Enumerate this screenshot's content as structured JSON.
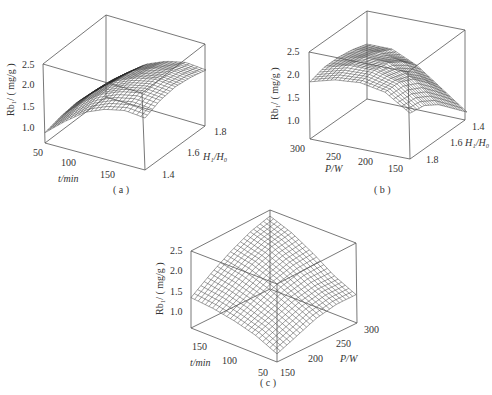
{
  "chart_data": [
    {
      "id": "a",
      "type": "surface3d",
      "caption": "( a )",
      "zlabel": "Rb₁/ ( mg/g )",
      "xlabel": "t/min",
      "ylabel": "H₁/H₀",
      "zticks": [
        "1.0",
        "1.5",
        "2.0",
        "2.5"
      ],
      "xticks": [
        "50",
        "100",
        "150"
      ],
      "yticks": [
        "1.4",
        "1.6",
        "1.8"
      ],
      "zlim": [
        0.6,
        2.5
      ],
      "xlim": [
        50,
        180
      ],
      "ylim": [
        1.3,
        1.9
      ],
      "surface_description": "Rises from ~0.9 at t=50 to plateau ~2.1 near t=150, peaks around H1/H0≈1.6",
      "grid_samples": {
        "x": [
          50,
          75,
          100,
          125,
          150,
          180
        ],
        "y": [
          1.3,
          1.45,
          1.6,
          1.75,
          1.9
        ],
        "z": [
          [
            0.85,
            0.95,
            1.0,
            0.95,
            0.9
          ],
          [
            1.25,
            1.4,
            1.45,
            1.4,
            1.3
          ],
          [
            1.6,
            1.75,
            1.8,
            1.75,
            1.65
          ],
          [
            1.8,
            1.95,
            2.0,
            1.95,
            1.85
          ],
          [
            1.9,
            2.05,
            2.1,
            2.05,
            1.95
          ],
          [
            1.85,
            2.0,
            2.05,
            2.0,
            1.9
          ]
        ]
      }
    },
    {
      "id": "b",
      "type": "surface3d",
      "caption": "( b )",
      "zlabel": "Rb₁/ ( mg/g )",
      "xlabel": "P/W",
      "ylabel": "H₁/H₀",
      "zticks": [
        "1.0",
        "1.5",
        "2.0",
        "2.5"
      ],
      "xticks": [
        "300",
        "250",
        "200",
        "150"
      ],
      "yticks": [
        "1.4",
        "1.6",
        "1.8"
      ],
      "zlim": [
        0.6,
        2.5
      ],
      "xlim": [
        300,
        140
      ],
      "ylim": [
        1.3,
        1.9
      ],
      "surface_description": "Dome-shaped; max ~2.1 near P≈230 W, H1/H0≈1.5; drops to ~0.8 at P=150, H1/H0=1.9",
      "grid_samples": {
        "x": [
          300,
          260,
          220,
          180,
          140
        ],
        "y": [
          1.3,
          1.45,
          1.6,
          1.75,
          1.9
        ],
        "z": [
          [
            1.85,
            1.95,
            1.95,
            1.9,
            1.8
          ],
          [
            2.0,
            2.1,
            2.05,
            1.95,
            1.8
          ],
          [
            2.05,
            2.1,
            2.05,
            1.85,
            1.55
          ],
          [
            1.95,
            1.95,
            1.8,
            1.5,
            1.15
          ],
          [
            1.6,
            1.55,
            1.35,
            1.05,
            0.75
          ]
        ]
      }
    },
    {
      "id": "c",
      "type": "surface3d",
      "caption": "( c )",
      "zlabel": "Rb₁/ ( mg/g )",
      "xlabel": "t/min",
      "ylabel": "P/W",
      "zticks": [
        "1.0",
        "1.5",
        "2.0",
        "2.5"
      ],
      "xticks": [
        "150",
        "100",
        "50"
      ],
      "yticks": [
        "150",
        "200",
        "250",
        "300"
      ],
      "zlim": [
        0.6,
        2.5
      ],
      "xlim": [
        180,
        40
      ],
      "ylim": [
        140,
        310
      ],
      "surface_description": "Peak ~2.4 at high t and high P (back corner); lowest ~0.8 at t=50, P=150 (front corner)",
      "grid_samples": {
        "x": [
          180,
          145,
          110,
          75,
          40
        ],
        "y": [
          140,
          182,
          225,
          268,
          310
        ],
        "z": [
          [
            1.35,
            1.7,
            2.0,
            2.25,
            2.4
          ],
          [
            1.3,
            1.6,
            1.9,
            2.1,
            2.2
          ],
          [
            1.2,
            1.45,
            1.7,
            1.85,
            1.9
          ],
          [
            1.05,
            1.25,
            1.45,
            1.55,
            1.55
          ],
          [
            0.8,
            1.0,
            1.2,
            1.3,
            1.3
          ]
        ]
      }
    }
  ],
  "panels": {
    "a": {
      "frame": {
        "top_back": [
          106,
          15
        ],
        "top_right": [
          205,
          44
        ],
        "top_left": [
          43,
          64
        ],
        "top_front": [
          142,
          93
        ],
        "bot_back": [
          106,
          97
        ],
        "bot_right": [
          205,
          126
        ],
        "bot_left": [
          45,
          143
        ],
        "bot_front": [
          145,
          170
        ]
      },
      "caption_pos": [
        123,
        192
      ]
    },
    "b": {
      "frame": {
        "top_back": [
          367,
          11
        ],
        "top_right": [
          465,
          30
        ],
        "top_left": [
          309,
          52
        ],
        "top_front": [
          408,
          72
        ],
        "bot_back": [
          367,
          99
        ],
        "bot_right": [
          465,
          120
        ],
        "bot_left": [
          310,
          139
        ],
        "bot_front": [
          410,
          159
        ]
      },
      "caption_pos": [
        384,
        192
      ]
    },
    "c": {
      "frame": {
        "top_back": [
          270,
          210
        ],
        "top_right": [
          356,
          243
        ],
        "top_left": [
          191,
          251
        ],
        "top_front": [
          277,
          284
        ],
        "bot_back": [
          270,
          289
        ],
        "bot_right": [
          357,
          323
        ],
        "bot_left": [
          191,
          328
        ],
        "bot_front": [
          277,
          362
        ]
      },
      "caption_pos": [
        270,
        384
      ]
    }
  }
}
